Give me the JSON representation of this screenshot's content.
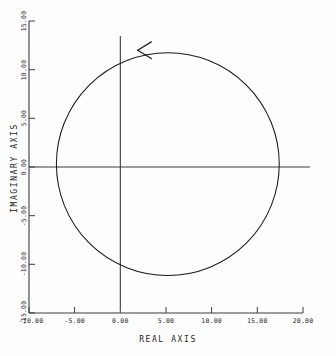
{
  "chart_data": {
    "type": "line",
    "title": "",
    "subtitle": "",
    "xlabel": "REAL AXIS",
    "ylabel": "IMAGINARY AXIS",
    "xlim": [
      -10.0,
      20.0
    ],
    "ylim": [
      -15.0,
      15.0
    ],
    "grid": false,
    "legend": null,
    "legend_position": "none",
    "xticks": [
      -10.0,
      -5.0,
      0.0,
      5.0,
      10.0,
      15.0,
      20.0
    ],
    "xtick_labels": [
      "-10.00",
      "-5.00",
      "0.00",
      "5.00",
      "10.00",
      "15.00",
      "20.00"
    ],
    "yticks": [
      -15.0,
      -10.0,
      -5.0,
      0.0,
      5.0,
      10.0,
      15.0
    ],
    "ytick_labels": [
      "-15.00",
      "-10.00",
      "-5.00",
      "0.00",
      "5.00",
      "10.00",
      "15.00"
    ],
    "series": [
      {
        "name": "nyquist-contour",
        "shape": "circle",
        "center": [
          5.2,
          0.3
        ],
        "radius": 12.2,
        "closed": true,
        "direction": "counterclockwise",
        "color": "#1a1a1a",
        "linewidth": 1.0
      }
    ],
    "annotations": [
      {
        "name": "direction-arrow",
        "kind": "arrowhead",
        "at": [
          1.9,
          12.0
        ],
        "points": "left",
        "color": "#1a1a1a"
      }
    ],
    "reference_lines": [
      {
        "name": "real-axis-line",
        "orientation": "horizontal",
        "value": 0.0,
        "color": "#3c3c3c"
      },
      {
        "name": "imaginary-axis-line",
        "orientation": "vertical",
        "value": 0.0,
        "color": "#3c3c3c"
      }
    ]
  },
  "axes": {
    "x": {
      "title": "REAL AXIS",
      "ticks": [
        {
          "value": -10.0,
          "label": "-10.00"
        },
        {
          "value": -5.0,
          "label": "-5.00"
        },
        {
          "value": 0.0,
          "label": "0.00"
        },
        {
          "value": 5.0,
          "label": "5.00"
        },
        {
          "value": 10.0,
          "label": "10.00"
        },
        {
          "value": 15.0,
          "label": "15.00"
        },
        {
          "value": 20.0,
          "label": "20.00"
        }
      ]
    },
    "y": {
      "title": "IMAGINARY AXIS",
      "ticks": [
        {
          "value": 15.0,
          "label": "15.00"
        },
        {
          "value": 10.0,
          "label": "10.00"
        },
        {
          "value": 5.0,
          "label": "5.00"
        },
        {
          "value": 0.0,
          "label": "0.00"
        },
        {
          "value": -5.0,
          "label": "-5.00"
        },
        {
          "value": -10.0,
          "label": "-10.00"
        },
        {
          "value": -15.0,
          "label": "-15.00"
        }
      ]
    }
  },
  "style": {
    "background": "#fdfdfd",
    "ink": "#1a1a1a",
    "axis_color": "#3c3c3c",
    "tick_color": "#2b2b2b"
  }
}
